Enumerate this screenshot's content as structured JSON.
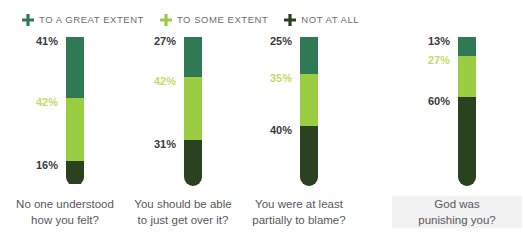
{
  "legend": {
    "items": [
      {
        "label": "TO A GREAT EXTENT",
        "icon": "plus-icon",
        "color": "#2F7A55"
      },
      {
        "label": "TO SOME EXTENT",
        "icon": "plus-icon",
        "color": "#9ACD42"
      },
      {
        "label": "NOT AT ALL",
        "icon": "plus-icon",
        "color": "#2B4220"
      }
    ],
    "text_color": "#6d6d6d"
  },
  "chart_data": {
    "type": "bar",
    "title": "",
    "subtitle": "",
    "xlabel": "",
    "ylabel": "",
    "ylim": [
      0,
      100
    ],
    "grid": false,
    "stacked": true,
    "orientation": "vertical",
    "legend_position": "top-left",
    "value_suffix": "%",
    "categories": [
      "No one understood how you felt?",
      "You should be able to just get over it?",
      "You were at least partially to blame?",
      "God was punishing you?"
    ],
    "category_lines": [
      [
        "No one understood",
        "how you felt?"
      ],
      [
        "You should be able",
        "to just get over it?"
      ],
      [
        "You were at least",
        "partially to blame?"
      ],
      [
        "God was",
        "punishing you?"
      ]
    ],
    "series": [
      {
        "name": "TO A GREAT EXTENT",
        "color": "#2F7A55",
        "values": [
          41,
          27,
          25,
          13
        ]
      },
      {
        "name": "TO SOME EXTENT",
        "color": "#9ACD42",
        "values": [
          42,
          42,
          35,
          27
        ]
      },
      {
        "name": "NOT AT ALL",
        "color": "#2B4220",
        "values": [
          16,
          31,
          40,
          60
        ]
      }
    ],
    "data_labels": [
      {
        "category": "No one understood how you felt?",
        "top": "41%",
        "middle": "42%",
        "bottom": "16%"
      },
      {
        "category": "You should be able to just get over it?",
        "top": "27%",
        "middle": "42%",
        "bottom": "31%"
      },
      {
        "category": "You were at least partially to blame?",
        "top": "25%",
        "middle": "35%",
        "bottom": "40%"
      },
      {
        "category": "God was punishing you?",
        "top": "13%",
        "middle": "27%",
        "bottom": "60%"
      }
    ]
  },
  "columns": [
    {
      "left": 0,
      "highlight": false,
      "labels": {
        "top": "41%",
        "middle": "42%",
        "bottom": "16%"
      },
      "line1": "No one understood",
      "line2": "how you felt?"
    },
    {
      "left": 118,
      "highlight": false,
      "labels": {
        "top": "27%",
        "middle": "42%",
        "bottom": "31%"
      },
      "line1": "You should be able",
      "line2": "to just get over it?"
    },
    {
      "left": 234,
      "highlight": false,
      "labels": {
        "top": "25%",
        "middle": "35%",
        "bottom": "40%"
      },
      "line1": "You were at least",
      "line2": "partially to blame?"
    },
    {
      "left": 392,
      "highlight": true,
      "labels": {
        "top": "13%",
        "middle": "27%",
        "bottom": "60%"
      },
      "line1": "God was",
      "line2": "punishing you?"
    }
  ]
}
